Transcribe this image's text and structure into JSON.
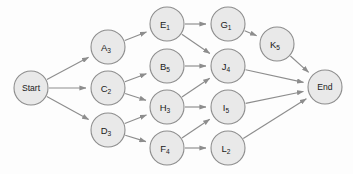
{
  "diagram": {
    "type": "directed-acyclic-graph",
    "palette": {
      "node_fill": "#e9e9e9",
      "node_stroke": "#8d8d8d",
      "edge_stroke": "#8d8d8d",
      "label_color": "#1a1a1a",
      "background": "#fdfdfd"
    },
    "node_radius": 17,
    "terminal_radius": 17,
    "nodes": [
      {
        "id": "Start",
        "base": "Start",
        "sub": "",
        "x": 31,
        "y": 88,
        "terminal": true
      },
      {
        "id": "A3",
        "base": "A",
        "sub": "3",
        "x": 108,
        "y": 47,
        "terminal": false
      },
      {
        "id": "C2",
        "base": "C",
        "sub": "2",
        "x": 108,
        "y": 88,
        "terminal": false
      },
      {
        "id": "D3",
        "base": "D",
        "sub": "3",
        "x": 108,
        "y": 130,
        "terminal": false
      },
      {
        "id": "E1",
        "base": "E",
        "sub": "1",
        "x": 167,
        "y": 24,
        "terminal": false
      },
      {
        "id": "B5",
        "base": "B",
        "sub": "5",
        "x": 167,
        "y": 66,
        "terminal": false
      },
      {
        "id": "H3",
        "base": "H",
        "sub": "3",
        "x": 167,
        "y": 107,
        "terminal": false
      },
      {
        "id": "F4",
        "base": "F",
        "sub": "4",
        "x": 167,
        "y": 148,
        "terminal": false
      },
      {
        "id": "G1",
        "base": "G",
        "sub": "1",
        "x": 228,
        "y": 24,
        "terminal": false
      },
      {
        "id": "J4",
        "base": "J",
        "sub": "4",
        "x": 228,
        "y": 66,
        "terminal": false
      },
      {
        "id": "I5",
        "base": "I",
        "sub": "5",
        "x": 228,
        "y": 107,
        "terminal": false
      },
      {
        "id": "L2",
        "base": "L",
        "sub": "2",
        "x": 228,
        "y": 148,
        "terminal": false
      },
      {
        "id": "K5",
        "base": "K",
        "sub": "5",
        "x": 277,
        "y": 44,
        "terminal": false
      },
      {
        "id": "End",
        "base": "End",
        "sub": "",
        "x": 325,
        "y": 87,
        "terminal": true
      }
    ],
    "edges": [
      {
        "from": "Start",
        "to": "A3"
      },
      {
        "from": "Start",
        "to": "C2"
      },
      {
        "from": "Start",
        "to": "D3"
      },
      {
        "from": "A3",
        "to": "E1"
      },
      {
        "from": "C2",
        "to": "B5"
      },
      {
        "from": "C2",
        "to": "H3"
      },
      {
        "from": "D3",
        "to": "H3"
      },
      {
        "from": "D3",
        "to": "F4"
      },
      {
        "from": "E1",
        "to": "G1"
      },
      {
        "from": "E1",
        "to": "J4"
      },
      {
        "from": "B5",
        "to": "J4"
      },
      {
        "from": "H3",
        "to": "J4"
      },
      {
        "from": "H3",
        "to": "I5"
      },
      {
        "from": "F4",
        "to": "I5"
      },
      {
        "from": "F4",
        "to": "L2"
      },
      {
        "from": "G1",
        "to": "K5"
      },
      {
        "from": "K5",
        "to": "End"
      },
      {
        "from": "J4",
        "to": "End"
      },
      {
        "from": "I5",
        "to": "End"
      },
      {
        "from": "L2",
        "to": "End"
      }
    ]
  }
}
